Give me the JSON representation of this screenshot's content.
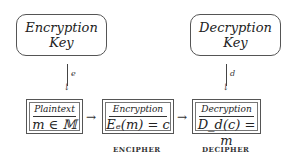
{
  "keys": {
    "encryption": {
      "line1": "Encryption",
      "line2": "Key"
    },
    "decryption": {
      "line1": "Decryption",
      "line2": "Key"
    }
  },
  "arrows": {
    "encryption_key_label": "e",
    "decryption_key_label": "d",
    "head_down": "↓",
    "head_right": "→"
  },
  "stages": [
    {
      "title": "Plaintext",
      "formula": "m ∈ 𝕄"
    },
    {
      "title": "Encryption",
      "formula": "Eₑ(m) = c"
    },
    {
      "title": "Decryption",
      "formula": "D_d(c) = m"
    }
  ],
  "captions": {
    "encipher": "ENCIPHER",
    "decipher": "DECIPHER"
  }
}
